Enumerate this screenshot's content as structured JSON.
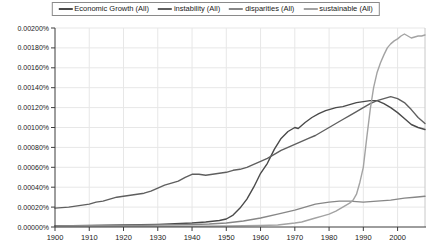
{
  "legend": {
    "position": "top-center"
  },
  "chart_data": {
    "type": "line",
    "title": "",
    "xlabel": "",
    "ylabel": "",
    "x_range": [
      1900,
      2008
    ],
    "ylim": [
      0,
      0.002
    ],
    "y_unit": "percent",
    "grid": true,
    "legend_position": "top",
    "x_ticks": [
      1900,
      1910,
      1920,
      1930,
      1940,
      1950,
      1960,
      1970,
      1980,
      1990,
      2000
    ],
    "y_tick_values": [
      0,
      0.0002,
      0.0004,
      0.0006,
      0.0008,
      0.001,
      0.0012,
      0.0014,
      0.0016,
      0.0018,
      0.002
    ],
    "y_tick_labels": [
      "0.00000%",
      "0.00020%",
      "0.00040%",
      "0.00060%",
      "0.00080%",
      "0.00100%",
      "0.00120%",
      "0.00140%",
      "0.00160%",
      "0.00180%",
      "0.00200%"
    ],
    "series": [
      {
        "name": "Economic Growth (All)",
        "color": "#4a4a4a",
        "points": [
          [
            1900,
            1.2e-05
          ],
          [
            1905,
            1.3e-05
          ],
          [
            1910,
            1.5e-05
          ],
          [
            1915,
            1.8e-05
          ],
          [
            1920,
            2e-05
          ],
          [
            1925,
            2.2e-05
          ],
          [
            1930,
            2.6e-05
          ],
          [
            1935,
            3.2e-05
          ],
          [
            1940,
            4e-05
          ],
          [
            1944,
            5e-05
          ],
          [
            1948,
            6.5e-05
          ],
          [
            1950,
            8e-05
          ],
          [
            1952,
            0.00012
          ],
          [
            1954,
            0.00019
          ],
          [
            1956,
            0.00028
          ],
          [
            1958,
            0.0004
          ],
          [
            1960,
            0.00054
          ],
          [
            1962,
            0.00064
          ],
          [
            1963,
            0.00071
          ],
          [
            1964,
            0.00078
          ],
          [
            1966,
            0.00089
          ],
          [
            1968,
            0.00096
          ],
          [
            1970,
            0.001
          ],
          [
            1971,
            0.00099
          ],
          [
            1973,
            0.00105
          ],
          [
            1975,
            0.0011
          ],
          [
            1977,
            0.00114
          ],
          [
            1979,
            0.00117
          ],
          [
            1980,
            0.00118
          ],
          [
            1982,
            0.0012
          ],
          [
            1984,
            0.00121
          ],
          [
            1986,
            0.00123
          ],
          [
            1988,
            0.00125
          ],
          [
            1990,
            0.00126
          ],
          [
            1992,
            0.00127
          ],
          [
            1994,
            0.00127
          ],
          [
            1996,
            0.00124
          ],
          [
            1998,
            0.0012
          ],
          [
            2000,
            0.00115
          ],
          [
            2002,
            0.00109
          ],
          [
            2004,
            0.00103
          ],
          [
            2006,
            0.001
          ],
          [
            2008,
            0.00098
          ]
        ]
      },
      {
        "name": "instability (All)",
        "color": "#5f5f5f",
        "points": [
          [
            1900,
            0.00019
          ],
          [
            1902,
            0.000195
          ],
          [
            1904,
            0.0002
          ],
          [
            1906,
            0.00021
          ],
          [
            1908,
            0.00022
          ],
          [
            1910,
            0.00023
          ],
          [
            1912,
            0.00025
          ],
          [
            1914,
            0.00026
          ],
          [
            1916,
            0.00028
          ],
          [
            1918,
            0.0003
          ],
          [
            1920,
            0.00031
          ],
          [
            1922,
            0.00032
          ],
          [
            1924,
            0.00033
          ],
          [
            1926,
            0.00034
          ],
          [
            1928,
            0.00036
          ],
          [
            1930,
            0.00039
          ],
          [
            1932,
            0.00042
          ],
          [
            1934,
            0.00044
          ],
          [
            1936,
            0.00046
          ],
          [
            1938,
            0.0005
          ],
          [
            1940,
            0.00053
          ],
          [
            1942,
            0.00053
          ],
          [
            1944,
            0.00052
          ],
          [
            1946,
            0.00053
          ],
          [
            1948,
            0.00054
          ],
          [
            1950,
            0.00055
          ],
          [
            1952,
            0.00057
          ],
          [
            1954,
            0.00058
          ],
          [
            1956,
            0.0006
          ],
          [
            1958,
            0.00063
          ],
          [
            1960,
            0.00066
          ],
          [
            1962,
            0.00069
          ],
          [
            1964,
            0.00073
          ],
          [
            1966,
            0.00077
          ],
          [
            1968,
            0.0008
          ],
          [
            1970,
            0.00083
          ],
          [
            1972,
            0.00086
          ],
          [
            1974,
            0.00089
          ],
          [
            1976,
            0.00092
          ],
          [
            1978,
            0.00096
          ],
          [
            1980,
            0.001
          ],
          [
            1982,
            0.00104
          ],
          [
            1984,
            0.00108
          ],
          [
            1986,
            0.00112
          ],
          [
            1988,
            0.00116
          ],
          [
            1990,
            0.0012
          ],
          [
            1992,
            0.00124
          ],
          [
            1994,
            0.00127
          ],
          [
            1996,
            0.00129
          ],
          [
            1998,
            0.00131
          ],
          [
            2000,
            0.00129
          ],
          [
            2002,
            0.00125
          ],
          [
            2004,
            0.00118
          ],
          [
            2006,
            0.0011
          ],
          [
            2008,
            0.00104
          ]
        ]
      },
      {
        "name": "disparities (All)",
        "color": "#878787",
        "points": [
          [
            1900,
            1e-05
          ],
          [
            1910,
            1.2e-05
          ],
          [
            1920,
            1.5e-05
          ],
          [
            1930,
            2e-05
          ],
          [
            1940,
            2.5e-05
          ],
          [
            1945,
            3e-05
          ],
          [
            1950,
            4e-05
          ],
          [
            1955,
            6e-05
          ],
          [
            1960,
            9e-05
          ],
          [
            1965,
            0.00013
          ],
          [
            1970,
            0.00017
          ],
          [
            1972,
            0.00019
          ],
          [
            1974,
            0.00021
          ],
          [
            1976,
            0.00023
          ],
          [
            1978,
            0.00024
          ],
          [
            1980,
            0.00025
          ],
          [
            1983,
            0.00026
          ],
          [
            1986,
            0.00026
          ],
          [
            1990,
            0.00025
          ],
          [
            1994,
            0.00026
          ],
          [
            1998,
            0.00027
          ],
          [
            2002,
            0.00029
          ],
          [
            2005,
            0.0003
          ],
          [
            2008,
            0.00031
          ]
        ]
      },
      {
        "name": "sustainable (All)",
        "color": "#a3a3a3",
        "points": [
          [
            1900,
            5e-06
          ],
          [
            1920,
            6e-06
          ],
          [
            1940,
            8e-06
          ],
          [
            1950,
            1e-05
          ],
          [
            1955,
            1.2e-05
          ],
          [
            1960,
            1.5e-05
          ],
          [
            1965,
            2e-05
          ],
          [
            1970,
            4e-05
          ],
          [
            1972,
            5e-05
          ],
          [
            1974,
            7e-05
          ],
          [
            1976,
            9e-05
          ],
          [
            1978,
            0.00011
          ],
          [
            1980,
            0.00013
          ],
          [
            1982,
            0.00016
          ],
          [
            1984,
            0.0002
          ],
          [
            1986,
            0.00024
          ],
          [
            1987,
            0.00027
          ],
          [
            1988,
            0.00033
          ],
          [
            1989,
            0.00045
          ],
          [
            1990,
            0.0006
          ],
          [
            1991,
            0.0009
          ],
          [
            1992,
            0.00118
          ],
          [
            1993,
            0.0014
          ],
          [
            1994,
            0.00155
          ],
          [
            1995,
            0.00165
          ],
          [
            1996,
            0.00173
          ],
          [
            1997,
            0.0018
          ],
          [
            1998,
            0.00184
          ],
          [
            1999,
            0.00187
          ],
          [
            2000,
            0.00189
          ],
          [
            2001,
            0.00192
          ],
          [
            2002,
            0.00194
          ],
          [
            2003,
            0.00192
          ],
          [
            2004,
            0.0019
          ],
          [
            2005,
            0.00191
          ],
          [
            2006,
            0.00192
          ],
          [
            2007,
            0.00192
          ],
          [
            2008,
            0.00193
          ]
        ]
      }
    ],
    "axis_color": "#3c3c3c",
    "gridline_color": "#e7e7e7",
    "plot_border_color": "#c8c8c8",
    "label_color": "#1a1a1a"
  }
}
